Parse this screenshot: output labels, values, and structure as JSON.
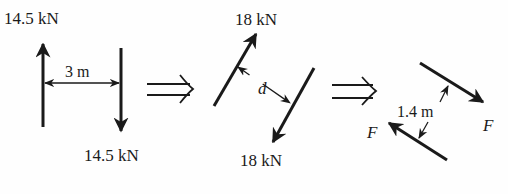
{
  "diagram": {
    "colors": {
      "ink": "#1a1a1a",
      "background": "#fefefe"
    },
    "panels": [
      {
        "id": "couple-1",
        "force_top_label": "14.5 kN",
        "force_bottom_label": "14.5 kN",
        "distance_label": "3 m"
      },
      {
        "id": "couple-2",
        "force_top_label": "18 kN",
        "force_bottom_label": "18 kN",
        "distance_label": "d"
      },
      {
        "id": "couple-3",
        "force_right_label": "F",
        "force_left_label": "F",
        "distance_label": "1.4 m"
      }
    ],
    "implies_symbol": "⇒"
  }
}
